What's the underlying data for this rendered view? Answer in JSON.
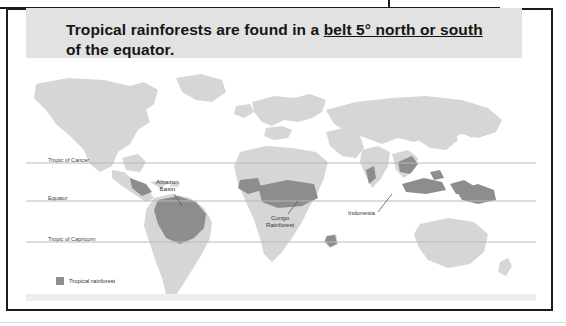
{
  "banner": {
    "line1_pre": "Tropical rainforests are found in a ",
    "line1_underlined": "belt 5° north or south",
    "line2": "of the equator."
  },
  "map": {
    "latitude_lines": [
      {
        "name": "tropic-of-cancer",
        "label": "Tropic of Cancer"
      },
      {
        "name": "equator",
        "label": "Equator"
      },
      {
        "name": "tropic-of-capricorn",
        "label": "Tropic of Capricorn"
      }
    ],
    "annotations": [
      {
        "name": "amazon-basin",
        "label_line1": "Amazon",
        "label_line2": "Basin"
      },
      {
        "name": "congo-rainforest",
        "label_line1": "Congo",
        "label_line2": "Rainforest"
      },
      {
        "name": "indonesia",
        "label_line1": "Indonesia",
        "label_line2": ""
      }
    ],
    "legend": {
      "swatch_color": "#8d8d8d",
      "label": "Tropical rainforest"
    },
    "colors": {
      "ocean": "#ffffff",
      "land": "#d6d6d6",
      "rainforest": "#8d8d8d",
      "latitude_line": "#b9b9b9",
      "frame": "#1c1c1c",
      "banner_background": "#e2e2e2"
    }
  }
}
